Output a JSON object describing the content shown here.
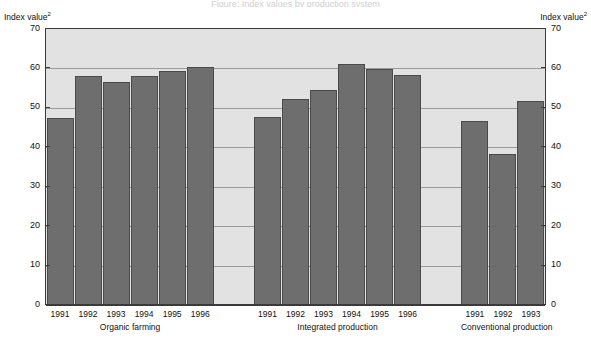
{
  "title_sliver": "Figure: Index values by production system",
  "axis": {
    "left_caption": "Index value",
    "left_caption_sup": "2",
    "right_caption": "Index value",
    "right_caption_sup": "2",
    "ticks": [
      "70",
      "60",
      "50",
      "40",
      "30",
      "20",
      "10",
      "0"
    ]
  },
  "chart_data": {
    "type": "bar",
    "title": "Index value",
    "xlabel": "",
    "ylabel": "Index value",
    "ylim": [
      0,
      70
    ],
    "ytick_values": [
      0,
      10,
      20,
      30,
      40,
      50,
      60,
      70
    ],
    "grid": true,
    "legend_position": "none",
    "groups": [
      {
        "name": "Organic farming",
        "categories": [
          "1991",
          "1992",
          "1993",
          "1994",
          "1995",
          "1996"
        ],
        "values": [
          47.5,
          58.0,
          56.6,
          58.0,
          59.3,
          60.4
        ]
      },
      {
        "name": "Integrated production",
        "categories": [
          "1991",
          "1992",
          "1993",
          "1994",
          "1995",
          "1996"
        ],
        "values": [
          47.8,
          52.2,
          54.6,
          61.0,
          59.8,
          58.4
        ]
      },
      {
        "name": "Conventional production",
        "categories": [
          "1991",
          "1992",
          "1993"
        ],
        "values": [
          46.7,
          38.2,
          51.7
        ]
      }
    ]
  }
}
